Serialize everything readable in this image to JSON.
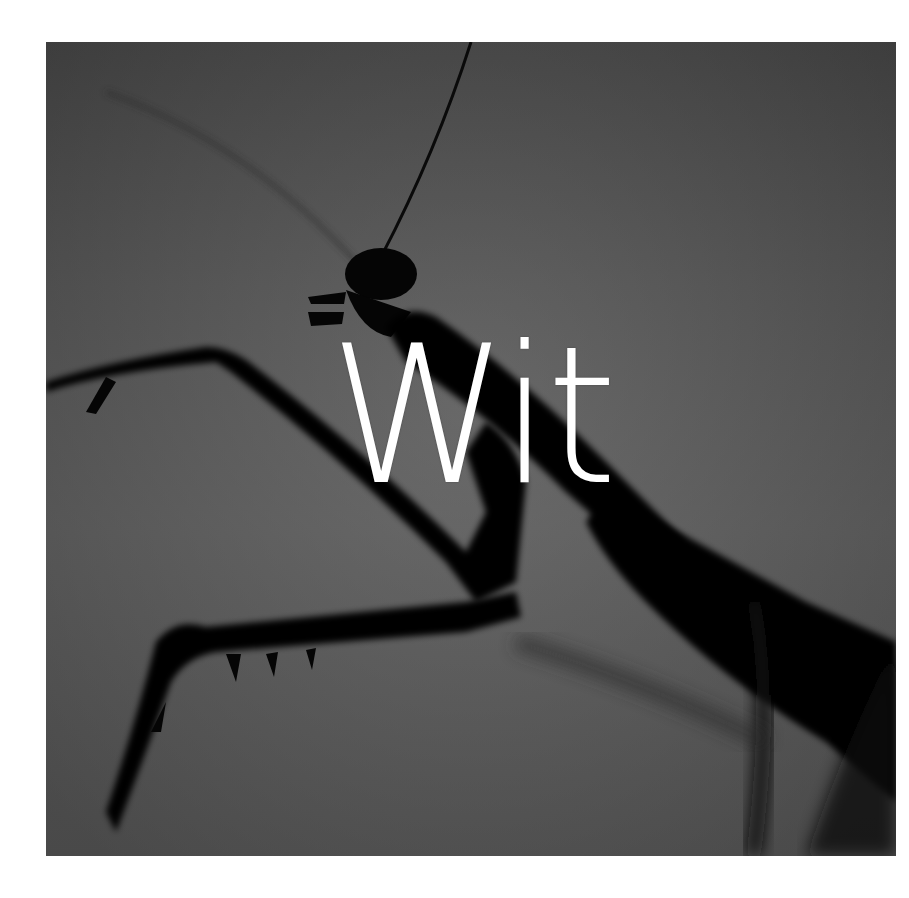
{
  "cover": {
    "title": "Wit",
    "subject": "praying-mantis-silhouette",
    "colors": {
      "background_page": "#ffffff",
      "photo_bg": "#5a5a5a",
      "silhouette": "#050505",
      "title_text": "#ffffff"
    }
  }
}
